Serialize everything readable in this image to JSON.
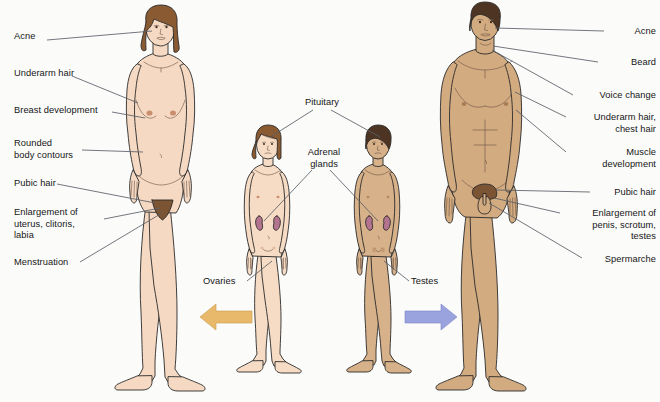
{
  "figure": {
    "background_color": "#fbfbfa"
  },
  "colors": {
    "female_skin": "#f6d9c2",
    "female_skin_shade": "#e9c3a6",
    "male_skin": "#d3ab80",
    "male_skin_shade": "#c0966b",
    "child_female_skin": "#f7dcc5",
    "child_male_skin": "#d7b189",
    "hair_female": "#8a5a33",
    "hair_male": "#4e3523",
    "pubic_hair": "#7b5433",
    "adrenal_gland": "#b4738f",
    "outline": "#2a2a2a",
    "leader_line": "#5a5f66",
    "arrow_left": "#e8b96a",
    "arrow_right": "#9aa3dd"
  },
  "labels_left": [
    {
      "id": "acne",
      "text": "Acne",
      "x": 14,
      "y": 36,
      "width": 66
    },
    {
      "id": "underarm-hair",
      "text": "Underarm hair",
      "x": 14,
      "y": 72,
      "width": 86
    },
    {
      "id": "breast-development",
      "text": "Breast development",
      "x": 14,
      "y": 108,
      "width": 110
    },
    {
      "id": "rounded-body-contours",
      "text": "Rounded\nbody contours",
      "x": 14,
      "y": 138,
      "width": 86
    },
    {
      "id": "pubic-hair",
      "text": "Pubic hair",
      "x": 14,
      "y": 180,
      "width": 66
    },
    {
      "id": "enlargement-uterus",
      "text": "Enlargement of\nuterus, clitoris,\nlabia",
      "x": 14,
      "y": 206,
      "width": 100
    },
    {
      "id": "menstruation",
      "text": "Menstruation",
      "x": 14,
      "y": 258,
      "width": 86
    }
  ],
  "labels_right": [
    {
      "id": "acne",
      "text": "Acne",
      "x": 608,
      "y": 28,
      "width": 48
    },
    {
      "id": "beard",
      "text": "Beard",
      "x": 602,
      "y": 58,
      "width": 54
    },
    {
      "id": "voice-change",
      "text": "Voice change",
      "x": 576,
      "y": 91,
      "width": 80
    },
    {
      "id": "underarm-chest-hair",
      "text": "Underarm hair,\nchest hair",
      "x": 570,
      "y": 112,
      "width": 86
    },
    {
      "id": "muscle-development",
      "text": "Muscle\ndevelopment",
      "x": 568,
      "y": 148,
      "width": 88
    },
    {
      "id": "pubic-hair",
      "text": "Pubic hair",
      "x": 594,
      "y": 188,
      "width": 62
    },
    {
      "id": "enlargement-penis",
      "text": "Enlargement of\npenis, scrotum,\ntestes",
      "x": 564,
      "y": 209,
      "width": 92
    },
    {
      "id": "spermarche",
      "text": "Spermarche",
      "x": 586,
      "y": 255,
      "width": 70
    }
  ],
  "labels_center": [
    {
      "id": "pituitary",
      "text": "Pituitary",
      "x": 302,
      "y": 97,
      "width": 56
    },
    {
      "id": "adrenal-glands",
      "text": "Adrenal\nglands",
      "x": 302,
      "y": 148,
      "width": 54
    },
    {
      "id": "ovaries",
      "text": "Ovaries",
      "x": 204,
      "y": 279,
      "width": 44
    },
    {
      "id": "testes",
      "text": "Testes",
      "x": 410,
      "y": 279,
      "width": 40
    }
  ],
  "arrows": [
    {
      "id": "arrow-female",
      "direction": "left",
      "color": "#e8b96a",
      "x": 200,
      "y": 303,
      "width": 52,
      "height": 28
    },
    {
      "id": "arrow-male",
      "direction": "right",
      "color": "#9aa3dd",
      "x": 405,
      "y": 303,
      "width": 52,
      "height": 28
    }
  ],
  "figures": [
    {
      "id": "adult-female",
      "label": "Adult female figure",
      "position": "far-left"
    },
    {
      "id": "child-female",
      "label": "Female child figure",
      "position": "center-left"
    },
    {
      "id": "child-male",
      "label": "Male child figure",
      "position": "center-right"
    },
    {
      "id": "adult-male",
      "label": "Adult male figure",
      "position": "far-right"
    }
  ]
}
